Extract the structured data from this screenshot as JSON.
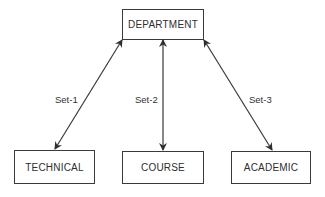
{
  "diagram": {
    "type": "hierarchy",
    "nodes": {
      "root": {
        "id": "department",
        "label": "DEPARTMENT"
      },
      "children": [
        {
          "id": "technical",
          "label": "TECHNICAL"
        },
        {
          "id": "course",
          "label": "COURSE"
        },
        {
          "id": "academic",
          "label": "ACADEMIC"
        }
      ]
    },
    "edges": [
      {
        "from": "department",
        "to": "technical",
        "label": "Set-1",
        "direction": "bidirectional"
      },
      {
        "from": "department",
        "to": "course",
        "label": "Set-2",
        "direction": "bidirectional"
      },
      {
        "from": "department",
        "to": "academic",
        "label": "Set-3",
        "direction": "bidirectional"
      }
    ],
    "colors": {
      "line": "#3a3a3a",
      "background": "#ffffff",
      "text": "#2e2e2e"
    }
  }
}
